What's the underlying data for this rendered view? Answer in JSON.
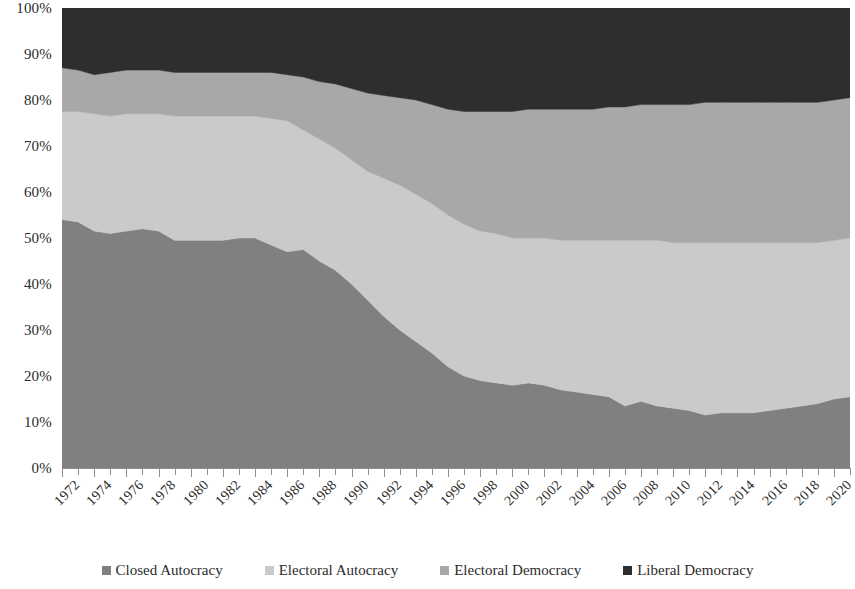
{
  "chart_data": {
    "type": "area",
    "stacked": true,
    "title": "",
    "subtitle": "",
    "xlabel": "",
    "ylabel": "",
    "ylim": [
      0,
      100
    ],
    "xlim": [
      1972,
      2021
    ],
    "grid": false,
    "legend_position": "bottom",
    "y_tick_labels": [
      "0%",
      "10%",
      "20%",
      "30%",
      "40%",
      "50%",
      "60%",
      "70%",
      "80%",
      "90%",
      "100%"
    ],
    "y_tick_values": [
      0,
      10,
      20,
      30,
      40,
      50,
      60,
      70,
      80,
      90,
      100
    ],
    "x_tick_labels": [
      "1972",
      "1974",
      "1976",
      "1978",
      "1980",
      "1982",
      "1984",
      "1986",
      "1988",
      "1990",
      "1992",
      "1994",
      "1996",
      "1998",
      "2000",
      "2002",
      "2004",
      "2006",
      "2008",
      "2010",
      "2012",
      "2014",
      "2016",
      "2018",
      "2020"
    ],
    "x": [
      1972,
      1973,
      1974,
      1975,
      1976,
      1977,
      1978,
      1979,
      1980,
      1981,
      1982,
      1983,
      1984,
      1985,
      1986,
      1987,
      1988,
      1989,
      1990,
      1991,
      1992,
      1993,
      1994,
      1995,
      1996,
      1997,
      1998,
      1999,
      2000,
      2001,
      2002,
      2003,
      2004,
      2005,
      2006,
      2007,
      2008,
      2009,
      2010,
      2011,
      2012,
      2013,
      2014,
      2015,
      2016,
      2017,
      2018,
      2019,
      2020,
      2021
    ],
    "series": [
      {
        "name": "Closed Autocracy",
        "color": "#808080",
        "values": [
          54.0,
          53.5,
          51.5,
          51.0,
          51.5,
          52.0,
          51.5,
          49.5,
          49.5,
          49.5,
          49.5,
          50.0,
          50.0,
          48.5,
          47.0,
          47.5,
          45.0,
          43.0,
          40.0,
          36.5,
          33.0,
          30.0,
          27.5,
          25.0,
          22.0,
          20.0,
          19.0,
          18.5,
          18.0,
          18.5,
          18.0,
          17.0,
          16.5,
          16.0,
          15.5,
          13.5,
          14.5,
          13.5,
          13.0,
          12.5,
          11.5,
          12.0,
          12.0,
          12.0,
          12.5,
          13.0,
          13.5,
          14.0,
          15.0,
          15.5
        ]
      },
      {
        "name": "Electoral Autocracy",
        "color": "#cacaca",
        "values": [
          23.5,
          24.0,
          25.5,
          25.5,
          25.5,
          25.0,
          25.5,
          27.0,
          27.0,
          27.0,
          27.0,
          26.5,
          26.5,
          27.5,
          28.5,
          26.0,
          26.5,
          26.5,
          27.0,
          28.0,
          30.0,
          31.5,
          32.0,
          32.5,
          33.0,
          33.0,
          32.5,
          32.5,
          32.0,
          31.5,
          32.0,
          32.5,
          33.0,
          33.5,
          34.0,
          36.0,
          35.0,
          36.0,
          36.0,
          36.5,
          37.5,
          37.0,
          37.0,
          37.0,
          36.5,
          36.0,
          35.5,
          35.0,
          34.5,
          34.5
        ]
      },
      {
        "name": "Electoral Democracy",
        "color": "#a8a8a8",
        "values": [
          9.5,
          9.0,
          8.5,
          9.5,
          9.5,
          9.5,
          9.5,
          9.5,
          9.5,
          9.5,
          9.5,
          9.5,
          9.5,
          10.0,
          10.0,
          11.5,
          12.5,
          14.0,
          15.5,
          17.0,
          18.0,
          19.0,
          20.5,
          21.5,
          23.0,
          24.5,
          26.0,
          26.5,
          27.5,
          28.0,
          28.0,
          28.5,
          28.5,
          28.5,
          29.0,
          29.0,
          29.5,
          29.5,
          30.0,
          30.0,
          30.5,
          30.5,
          30.5,
          30.5,
          30.5,
          30.5,
          30.5,
          30.5,
          30.5,
          30.5
        ]
      },
      {
        "name": "Liberal Democracy",
        "color": "#2e2e2e",
        "values": [
          13.0,
          13.5,
          14.5,
          14.0,
          13.5,
          13.5,
          13.5,
          14.0,
          14.0,
          14.0,
          14.0,
          14.0,
          14.0,
          14.0,
          14.5,
          15.0,
          16.0,
          16.5,
          17.5,
          18.5,
          19.0,
          19.5,
          20.0,
          21.0,
          22.0,
          22.5,
          22.5,
          22.5,
          22.5,
          22.0,
          22.0,
          22.0,
          22.0,
          22.0,
          21.5,
          21.5,
          21.0,
          21.0,
          21.0,
          21.0,
          20.5,
          20.5,
          20.5,
          20.5,
          20.5,
          20.5,
          20.5,
          20.5,
          20.0,
          19.5
        ]
      }
    ]
  },
  "legend": {
    "items": [
      {
        "label": "Closed Autocracy",
        "color": "#808080"
      },
      {
        "label": "Electoral Autocracy",
        "color": "#cacaca"
      },
      {
        "label": "Electoral Democracy",
        "color": "#a8a8a8"
      },
      {
        "label": "Liberal Democracy",
        "color": "#2e2e2e"
      }
    ]
  }
}
